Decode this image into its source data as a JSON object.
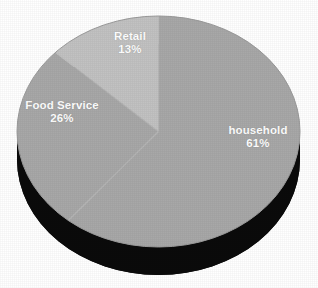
{
  "chart_data": {
    "type": "pie",
    "title": "",
    "subtitle": "",
    "xlabel": "",
    "ylabel": "",
    "legend_position": "none",
    "grid": false,
    "three_d": true,
    "categories": [
      "household",
      "Food Service",
      "Retail"
    ],
    "values": [
      61,
      26,
      13
    ],
    "value_unit": "%",
    "slices": [
      {
        "label": "household",
        "value": 61,
        "value_label": "61%",
        "color": "#a8a8a8",
        "start_angle_deg": 0,
        "end_angle_deg": 219.6
      },
      {
        "label": "Food Service",
        "value": 26,
        "value_label": "26%",
        "color": "#a8a8a8",
        "start_angle_deg": 219.6,
        "end_angle_deg": 313.2
      },
      {
        "label": "Retail",
        "value": 13,
        "value_label": "13%",
        "color": "#c2c2c2",
        "start_angle_deg": 313.2,
        "end_angle_deg": 360
      }
    ],
    "colors": {
      "background": "#ffffff",
      "slice_main": "#a8a8a8",
      "slice_light": "#c2c2c2",
      "depth_shadow": "#0b0b0b",
      "label_text": "#ffffff",
      "slice_divider": "#bdbdbd"
    }
  },
  "labels": {
    "retail": {
      "name": "Retail",
      "value": "13%"
    },
    "food_service": {
      "name": "Food Service",
      "value": "26%"
    },
    "household": {
      "name": "household",
      "value": "61%"
    }
  }
}
